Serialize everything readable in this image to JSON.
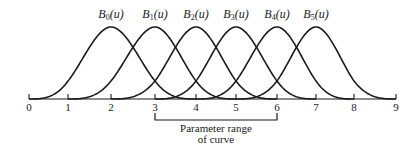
{
  "figure": {
    "title": "",
    "basis_functions": [
      {
        "name": "B",
        "index": "0",
        "arg": "(u)",
        "knots": [
          0,
          1,
          2,
          3,
          4
        ],
        "peak_at": 2
      },
      {
        "name": "B",
        "index": "1",
        "arg": "(u)",
        "knots": [
          1,
          2,
          3,
          4,
          5
        ],
        "peak_at": 3
      },
      {
        "name": "B",
        "index": "2",
        "arg": "(u)",
        "knots": [
          2,
          3,
          4,
          5,
          6
        ],
        "peak_at": 4
      },
      {
        "name": "B",
        "index": "3",
        "arg": "(u)",
        "knots": [
          3,
          4,
          5,
          6,
          7
        ],
        "peak_at": 5
      },
      {
        "name": "B",
        "index": "4",
        "arg": "(u)",
        "knots": [
          4,
          5,
          6,
          7,
          8
        ],
        "peak_at": 6
      },
      {
        "name": "B",
        "index": "5",
        "arg": "(u)",
        "knots": [
          5,
          6,
          7,
          8,
          9
        ],
        "peak_at": 7
      }
    ],
    "axis": {
      "ticks": [
        "0",
        "1",
        "2",
        "3",
        "4",
        "5",
        "6",
        "7",
        "8",
        "9"
      ],
      "tick_x_px": [
        29,
        68,
        111,
        155,
        196,
        236,
        277,
        316,
        354,
        396
      ],
      "baseline_y_px": 99
    },
    "parameter_range": {
      "label_line1": "Parameter range",
      "label_line2": "of curve",
      "from": 3,
      "to": 6
    },
    "style": {
      "stroke_color": "#1a1a1a",
      "peak_y_px": 27
    }
  }
}
